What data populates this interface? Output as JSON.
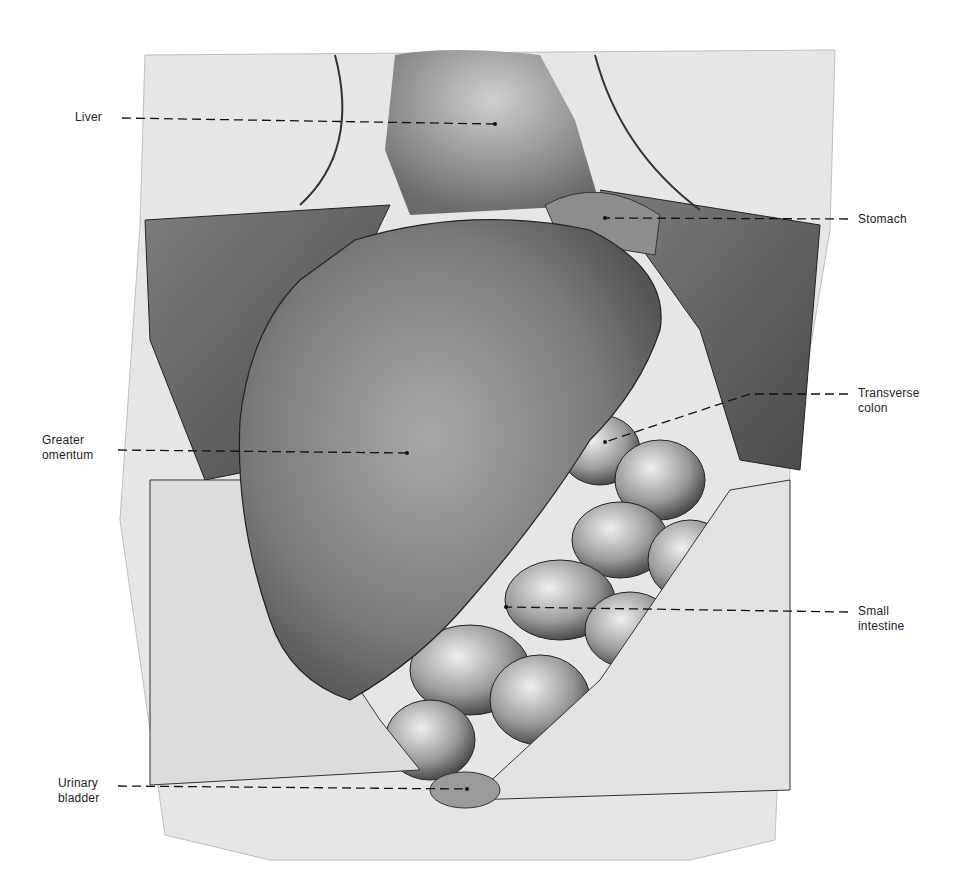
{
  "figure": {
    "type": "anatomical illustration",
    "colors": {
      "background": "#ffffff",
      "ink": "#1a1a1a",
      "tissue_dark": "#3a3a3a",
      "tissue_mid": "#8a8a8a",
      "tissue_light": "#d9d9d9"
    }
  },
  "labels": [
    {
      "id": "liver",
      "lines": [
        "Liver"
      ],
      "side": "left",
      "text_x": 75,
      "text_y": 110,
      "line_from": [
        122,
        118
      ],
      "line_to": [
        495,
        124
      ]
    },
    {
      "id": "stomach",
      "lines": [
        "Stomach"
      ],
      "side": "right",
      "text_x": 858,
      "text_y": 212,
      "line_from": [
        848,
        219
      ],
      "line_to": [
        605,
        218
      ]
    },
    {
      "id": "transverse-colon",
      "lines": [
        "Transverse",
        "colon"
      ],
      "side": "right",
      "text_x": 858,
      "text_y": 386,
      "line_from": [
        848,
        394
      ],
      "line_to": [
        605,
        442
      ]
    },
    {
      "id": "greater-omentum",
      "lines": [
        "Greater",
        "omentum"
      ],
      "side": "left",
      "text_x": 42,
      "text_y": 433,
      "line_from": [
        118,
        450
      ],
      "line_to": [
        407,
        453
      ]
    },
    {
      "id": "small-intestine",
      "lines": [
        "Small",
        "intestine"
      ],
      "side": "right",
      "text_x": 858,
      "text_y": 604,
      "line_from": [
        848,
        612
      ],
      "line_to": [
        506,
        607
      ]
    },
    {
      "id": "urinary-bladder",
      "lines": [
        "Urinary",
        "bladder"
      ],
      "side": "left",
      "text_x": 58,
      "text_y": 776,
      "line_from": [
        118,
        786
      ],
      "line_to": [
        467,
        789
      ]
    }
  ]
}
